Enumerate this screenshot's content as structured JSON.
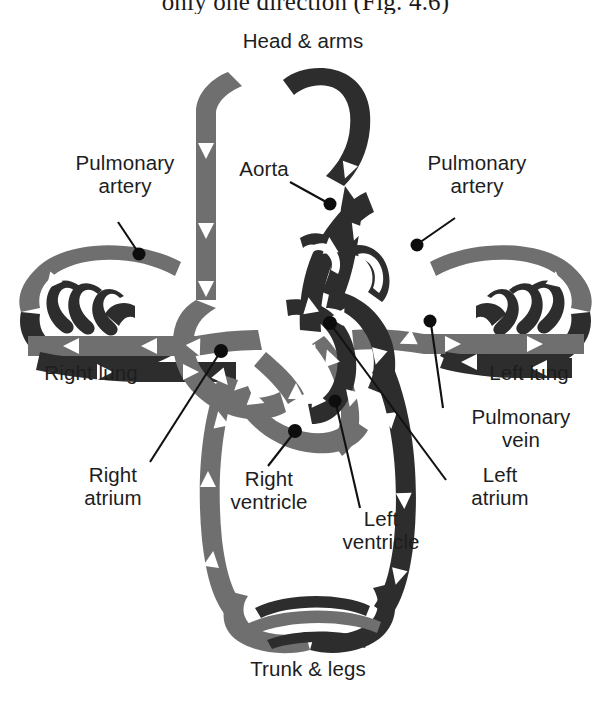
{
  "figure": {
    "title_partial": "only one direction (Fig. 4.6)",
    "type": "anatomical-diagram",
    "background_color": "#ffffff",
    "colors": {
      "deoxygenated_vessel": "#6f6f6f",
      "oxygenated_vessel": "#2d2d2d",
      "arrow": "#ffffff",
      "leader_line": "#111111",
      "label_text": "#1d1d1d"
    }
  },
  "labels": {
    "head_arms": "Head & arms",
    "trunk_legs": "Trunk & legs",
    "right_lung": "Right lung",
    "left_lung": "Left lung",
    "pulmonary_artery_left": "Pulmonary\nartery",
    "pulmonary_artery_right": "Pulmonary\nartery",
    "aorta": "Aorta",
    "pulmonary_vein": "Pulmonary\nvein",
    "right_atrium": "Right\natrium",
    "right_ventricle": "Right\nventricle",
    "left_atrium": "Left\natrium",
    "left_ventricle": "Left\nventricle"
  },
  "diagram_data": {
    "capillary_beds": [
      {
        "name": "head-and-arms",
        "position": "top",
        "label": "Head & arms"
      },
      {
        "name": "trunk-and-legs",
        "position": "bottom",
        "label": "Trunk & legs"
      },
      {
        "name": "right-lung",
        "position": "left",
        "label": "Right lung"
      },
      {
        "name": "left-lung",
        "position": "right",
        "label": "Left lung"
      }
    ],
    "heart_chambers": [
      {
        "name": "right-atrium",
        "label": "Right atrium",
        "blood": "deoxygenated"
      },
      {
        "name": "right-ventricle",
        "label": "Right ventricle",
        "blood": "deoxygenated"
      },
      {
        "name": "left-atrium",
        "label": "Left atrium",
        "blood": "oxygenated"
      },
      {
        "name": "left-ventricle",
        "label": "Left ventricle",
        "blood": "oxygenated"
      }
    ],
    "vessels": [
      {
        "name": "aorta",
        "label": "Aorta",
        "blood": "oxygenated"
      },
      {
        "name": "pulmonary-artery-left",
        "label": "Pulmonary artery",
        "blood": "deoxygenated"
      },
      {
        "name": "pulmonary-artery-right",
        "label": "Pulmonary artery",
        "blood": "deoxygenated"
      },
      {
        "name": "pulmonary-vein",
        "label": "Pulmonary vein",
        "blood": "oxygenated"
      }
    ]
  }
}
